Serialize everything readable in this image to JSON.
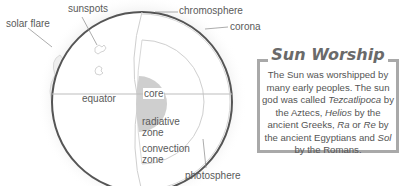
{
  "labels": {
    "sunspots": "sunspots",
    "chromosphere": "chromosphere",
    "solar_flare": "solar flare",
    "corona": "corona",
    "equator": "equator",
    "core": "core",
    "radiative_line1": "radiative",
    "radiative_line2": "zone",
    "convection_line1": "convection",
    "convection_line2": "zone",
    "photosphere": "photosphere"
  },
  "sidebar_box": {
    "title": "Sun Worship",
    "text_parts": {
      "p1": "The Sun was worshipped by many early peoples. The sun god was called ",
      "tezcatlipoca": "Tezcatlipoca",
      "p2": " by the Aztecs, ",
      "helios": "Helios",
      "p3": " by the ancient Greeks, ",
      "ra": "Ra",
      "p4": " or ",
      "re": "Re",
      "p5": " by the ancient Egyptians and ",
      "sol": "Sol",
      "p6": " by the Romans."
    }
  },
  "colors": {
    "border": "#a9a9a9",
    "core_fill": "#cfcfcf",
    "sphere_edge": "#555555",
    "text": "#555555"
  }
}
